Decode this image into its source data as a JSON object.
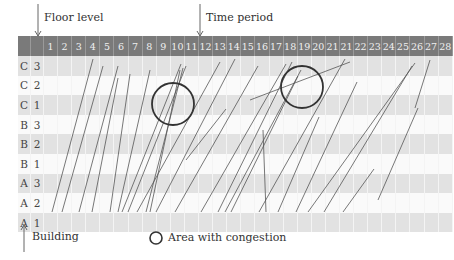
{
  "labels": {
    "floor_level": "Floor level",
    "time_period": "Time period",
    "building": "Building",
    "legend": "Area with congestion"
  },
  "time_columns": [
    "1",
    "2",
    "3",
    "4",
    "5",
    "6",
    "7",
    "8",
    "9",
    "10",
    "11",
    "12",
    "13",
    "14",
    "15",
    "16",
    "17",
    "18",
    "19",
    "20",
    "21",
    "21",
    "22",
    "23",
    "24",
    "25",
    "26",
    "27",
    "28"
  ],
  "rows": [
    {
      "building": "C",
      "floor": "3"
    },
    {
      "building": "C",
      "floor": "2"
    },
    {
      "building": "C",
      "floor": "1"
    },
    {
      "building": "B",
      "floor": "3"
    },
    {
      "building": "B",
      "floor": "2"
    },
    {
      "building": "B",
      "floor": "1"
    },
    {
      "building": "A",
      "floor": "3"
    },
    {
      "building": "A",
      "floor": "2"
    },
    {
      "building": "A",
      "floor": "1"
    }
  ],
  "colors": {
    "header": "#7a7a7a",
    "shade": "#e2e2e2",
    "line": "#555555",
    "circle": "#333333"
  },
  "congestion_areas": [
    {
      "cx": 173,
      "cy": 104,
      "r": 21
    },
    {
      "cx": 302,
      "cy": 87,
      "r": 21
    }
  ],
  "trajectories": [
    [
      52,
      212,
      93,
      59
    ],
    [
      62,
      212,
      103,
      66
    ],
    [
      79,
      212,
      118,
      66
    ],
    [
      92,
      212,
      118,
      78
    ],
    [
      110,
      212,
      130,
      74
    ],
    [
      118,
      212,
      150,
      70
    ],
    [
      122,
      212,
      181,
      64
    ],
    [
      128,
      212,
      186,
      66
    ],
    [
      146,
      212,
      183,
      68
    ],
    [
      150,
      212,
      180,
      70
    ],
    [
      137,
      212,
      220,
      62
    ],
    [
      156,
      212,
      235,
      59
    ],
    [
      175,
      212,
      258,
      66
    ],
    [
      201,
      212,
      286,
      64
    ],
    [
      218,
      212,
      292,
      62
    ],
    [
      225,
      212,
      301,
      70
    ],
    [
      231,
      212,
      298,
      76
    ],
    [
      259,
      212,
      345,
      59
    ],
    [
      278,
      212,
      319,
      117
    ],
    [
      296,
      212,
      357,
      82
    ],
    [
      308,
      212,
      415,
      63
    ],
    [
      324,
      212,
      412,
      66
    ],
    [
      343,
      212,
      374,
      169
    ],
    [
      250,
      100,
      350,
      62
    ],
    [
      186,
      160,
      226,
      109
    ],
    [
      378,
      200,
      418,
      108
    ],
    [
      415,
      108,
      430,
      60
    ],
    [
      263,
      130,
      266,
      212
    ]
  ]
}
